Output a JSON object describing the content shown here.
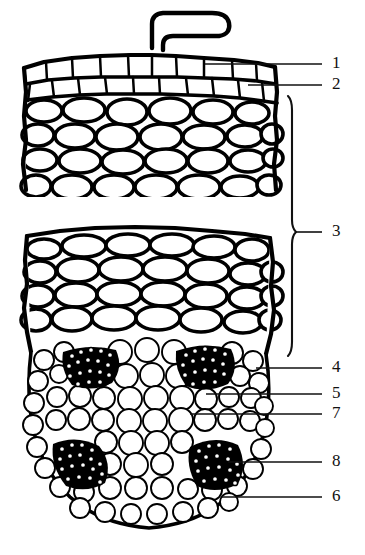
{
  "figure": {
    "type": "botanical-line-drawing",
    "background_color": "#ffffff",
    "ink_color": "#000000",
    "width": 365,
    "height": 555
  },
  "labels": [
    {
      "id": "1",
      "text": "1",
      "leader_y": 64,
      "leader_x_start": 205,
      "leader_x_end": 322,
      "number_x": 334,
      "number_y": 64,
      "kind": "line"
    },
    {
      "id": "2",
      "text": "2",
      "leader_y": 85,
      "leader_x_start": 248,
      "leader_x_end": 322,
      "number_x": 334,
      "number_y": 85,
      "kind": "line"
    },
    {
      "id": "3",
      "text": "3",
      "leader_y": 232,
      "leader_x_start": 296,
      "leader_x_end": 322,
      "number_x": 334,
      "number_y": 232,
      "kind": "brace"
    },
    {
      "id": "4",
      "text": "4",
      "leader_y": 368,
      "leader_x_start": 256,
      "leader_x_end": 322,
      "number_x": 334,
      "number_y": 368,
      "kind": "line"
    },
    {
      "id": "5",
      "text": "5",
      "leader_y": 394,
      "leader_x_start": 206,
      "leader_x_end": 322,
      "number_x": 334,
      "number_y": 394,
      "kind": "line"
    },
    {
      "id": "7",
      "text": "7",
      "leader_y": 414,
      "leader_x_start": 190,
      "leader_x_end": 322,
      "number_x": 334,
      "number_y": 414,
      "kind": "line"
    },
    {
      "id": "8",
      "text": "8",
      "leader_y": 462,
      "leader_x_start": 228,
      "leader_x_end": 322,
      "number_x": 334,
      "number_y": 462,
      "kind": "line"
    },
    {
      "id": "6",
      "text": "6",
      "leader_y": 497,
      "leader_x_start": 222,
      "leader_x_end": 322,
      "number_x": 334,
      "number_y": 497,
      "kind": "line"
    }
  ],
  "brace": {
    "name": "bracket-for-label-3",
    "x": 290,
    "y_top": 96,
    "y_bottom": 356,
    "tip_y": 232
  },
  "regions": [
    {
      "name": "root-hair",
      "description": "single elongated hair projecting from the upper surface"
    },
    {
      "name": "epidermis-row",
      "description": "outer single row of small rectangular cells (label 1)"
    },
    {
      "name": "hypodermis-row",
      "description": "second row of cells beneath the epidermis (label 2)"
    },
    {
      "name": "cortex",
      "description": "broad zone of large rounded parenchyma cells (label 3)"
    },
    {
      "name": "endodermis",
      "description": "ring of cells bounding the stele (label 4)"
    },
    {
      "name": "pericycle",
      "description": "layer just inside the endodermis (label 5)"
    },
    {
      "name": "pith-parenchyma",
      "description": "central ground tissue of small polygonal cells (label 7)"
    },
    {
      "name": "phloem-patch",
      "description": "dark stippled strands, four groups around the stele (label 8)"
    },
    {
      "name": "xylem-patch",
      "description": "dark stippled strands toward the lower stele (label 6)"
    }
  ],
  "break_gap": {
    "y_top": 196,
    "y_bottom": 226,
    "description": "drawing interrupted to shorten the cortex"
  }
}
